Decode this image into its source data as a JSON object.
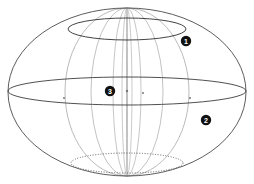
{
  "figure": {
    "background_color": "#ffffff",
    "width": 254,
    "height": 184,
    "outline_color": "#4a4a4a",
    "grid_color": "#b0b0b0",
    "marker_fill": "#111111",
    "marker_text_color": "#ffffff",
    "dot_color": "#777777"
  },
  "shapes": {
    "sphere_outline": {
      "name": "sphere-outline",
      "cx": 127,
      "cy": 92,
      "rx": 119,
      "ry": 84,
      "stroke": "#4a4a4a",
      "stroke_width": 0.9,
      "dash": "none"
    },
    "top_latitude_ring": {
      "name": "top-latitude-ring",
      "cx": 127,
      "cy": 29,
      "rx": 59,
      "ry": 11,
      "stroke": "#2f2f2f",
      "stroke_width": 0.9,
      "dash": "none"
    },
    "equator_ring": {
      "name": "equator-ring",
      "cx": 127,
      "cy": 91,
      "rx": 119,
      "ry": 14,
      "stroke": "#3c3c3c",
      "stroke_width": 0.9,
      "dash": "none"
    },
    "bottom_latitude_ring": {
      "name": "bottom-latitude-ring",
      "cx": 127,
      "cy": 163,
      "rx": 56,
      "ry": 10,
      "stroke": "#555555",
      "stroke_width": 0.9,
      "dash": "1,1.6"
    },
    "meridians": [
      {
        "name": "meridian-outer-left",
        "cx": 127,
        "cy": 92,
        "rx": 62,
        "ry": 84,
        "stroke": "#a8a8a8",
        "stroke_width": 0.8
      },
      {
        "name": "meridian-mid-left",
        "cx": 127,
        "cy": 92,
        "rx": 36,
        "ry": 84,
        "stroke": "#b2b2b2",
        "stroke_width": 0.8
      },
      {
        "name": "meridian-inner-left",
        "cx": 127,
        "cy": 92,
        "rx": 14,
        "ry": 84,
        "stroke": "#b8b8b8",
        "stroke_width": 0.8
      },
      {
        "name": "meridian-inner-right",
        "cx": 127,
        "cy": 92,
        "rx": 5,
        "ry": 84,
        "stroke": "#bcbcbc",
        "stroke_width": 0.8
      },
      {
        "name": "meridian-axis",
        "cx": 127,
        "cy": 92,
        "rx": 0.4,
        "ry": 84,
        "stroke": "#aaaaaa",
        "stroke_width": 0.8
      }
    ],
    "equator_dots": [
      {
        "name": "equator-dot-1",
        "cx": 64,
        "cy": 98,
        "r": 1.0
      },
      {
        "name": "equator-dot-2",
        "cx": 127,
        "cy": 91,
        "r": 1.2
      },
      {
        "name": "equator-dot-3",
        "cx": 143,
        "cy": 93,
        "r": 1.0
      },
      {
        "name": "equator-dot-4",
        "cx": 190,
        "cy": 98,
        "r": 1.0
      }
    ]
  },
  "markers": [
    {
      "name": "marker-1",
      "label": "1",
      "cx": 186,
      "cy": 41,
      "r": 5.2
    },
    {
      "name": "marker-2",
      "label": "2",
      "cx": 206,
      "cy": 120,
      "r": 5.2
    },
    {
      "name": "marker-3",
      "label": "3",
      "cx": 110,
      "cy": 91,
      "r": 5.2
    }
  ]
}
